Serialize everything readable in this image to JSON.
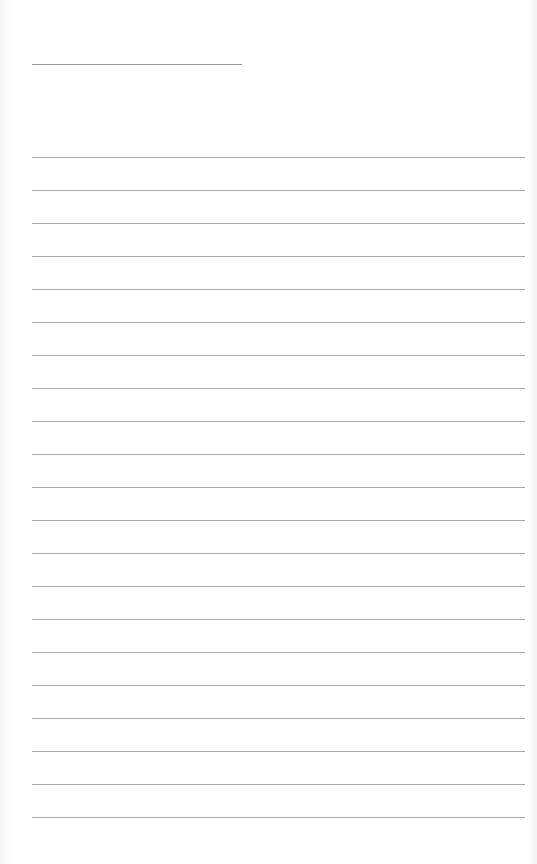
{
  "page": {
    "type": "lined-paper",
    "header_line": {
      "x": 32,
      "y": 64,
      "width": 210
    },
    "ruled_lines": {
      "count": 21,
      "start_y": 157,
      "spacing": 33,
      "x": 32,
      "width": 493
    },
    "colors": {
      "background": "#ffffff",
      "line": "#a8a8a8"
    }
  }
}
